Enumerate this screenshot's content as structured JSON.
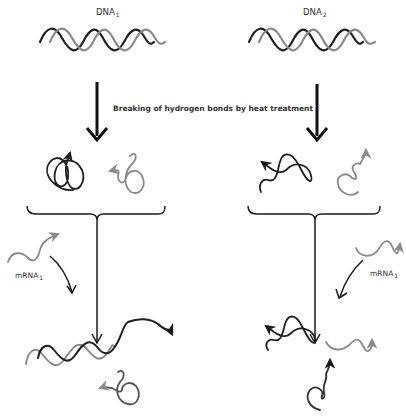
{
  "diagram": {
    "colors": {
      "dna_strand_dark": "#1e1e1e",
      "dna_strand_light": "#8a8a8a",
      "mrna": "#8a8a8a",
      "arrows": "#1a1a1a"
    },
    "labels": {
      "dna1": {
        "name": "DNA",
        "sub": "1"
      },
      "dna2": {
        "name": "DNA",
        "sub": "2"
      },
      "process": "Breaking of hydrogen bonds by heat treatment",
      "mrna_left": {
        "name": "mRNA",
        "sub": "1"
      },
      "mrna_right": {
        "name": "mRNA",
        "sub": "1"
      }
    },
    "stages": [
      "Double-stranded DNA",
      "Heat-denatured single strands",
      "Mixed with mRNA",
      "Hybridization result"
    ],
    "outcomes": {
      "left": "mRNA1 hybridizes with DNA1 strand",
      "right": "mRNA1 does not hybridize with DNA2 strands"
    }
  }
}
